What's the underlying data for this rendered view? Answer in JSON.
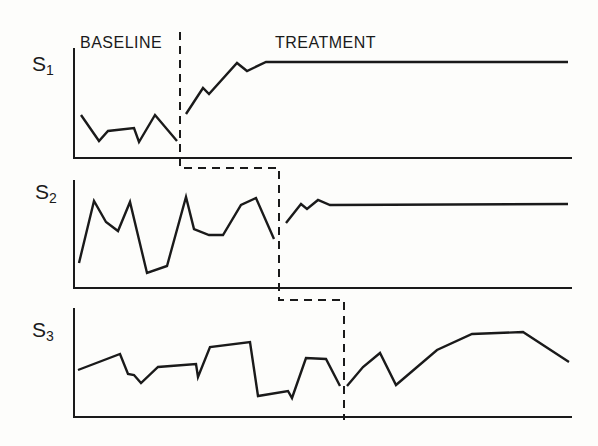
{
  "chart_data": {
    "type": "line",
    "title": "",
    "phase_labels": [
      "BASELINE",
      "TREATMENT"
    ],
    "xlabel": "",
    "ylabel": "",
    "grid": false,
    "legend": "none",
    "design": "multiple-baseline across subjects",
    "series": [
      {
        "name": "S1",
        "label_main": "S",
        "label_sub": "1",
        "axis": {
          "x0": 74,
          "x1": 572,
          "y_top": 48,
          "y_base": 158
        },
        "phase_change_x": 180,
        "baseline": [
          [
            81,
            115
          ],
          [
            99,
            141
          ],
          [
            108,
            131
          ],
          [
            134,
            128
          ],
          [
            139,
            142
          ],
          [
            155,
            115
          ],
          [
            177,
            141
          ]
        ],
        "treatment": [
          [
            186,
            114
          ],
          [
            203,
            88
          ],
          [
            209,
            94
          ],
          [
            237,
            63
          ],
          [
            247,
            71
          ],
          [
            266,
            62
          ],
          [
            568,
            62
          ]
        ]
      },
      {
        "name": "S2",
        "label_main": "S",
        "label_sub": "2",
        "axis": {
          "x0": 74,
          "x1": 572,
          "y_top": 180,
          "y_base": 288
        },
        "phase_change_x": 279,
        "baseline": [
          [
            79,
            263
          ],
          [
            94,
            201
          ],
          [
            106,
            222
          ],
          [
            118,
            231
          ],
          [
            130,
            202
          ],
          [
            147,
            273
          ],
          [
            167,
            266
          ],
          [
            186,
            197
          ],
          [
            194,
            229
          ],
          [
            209,
            235
          ],
          [
            223,
            235
          ],
          [
            241,
            205
          ],
          [
            256,
            198
          ],
          [
            274,
            239
          ]
        ],
        "treatment": [
          [
            286,
            223
          ],
          [
            301,
            204
          ],
          [
            307,
            209
          ],
          [
            318,
            200
          ],
          [
            330,
            205
          ],
          [
            568,
            204
          ]
        ]
      },
      {
        "name": "S3",
        "label_main": "S",
        "label_sub": "3",
        "axis": {
          "x0": 74,
          "x1": 572,
          "y_top": 308,
          "y_base": 417
        },
        "phase_change_x": 344,
        "baseline": [
          [
            78,
            370
          ],
          [
            120,
            354
          ],
          [
            128,
            374
          ],
          [
            134,
            375
          ],
          [
            141,
            383
          ],
          [
            158,
            367
          ],
          [
            196,
            364
          ],
          [
            198,
            377
          ],
          [
            210,
            347
          ],
          [
            250,
            342
          ],
          [
            258,
            396
          ],
          [
            288,
            391
          ],
          [
            292,
            398
          ],
          [
            306,
            358
          ],
          [
            326,
            359
          ],
          [
            340,
            386
          ]
        ],
        "treatment": [
          [
            347,
            386
          ],
          [
            363,
            367
          ],
          [
            380,
            353
          ],
          [
            396,
            385
          ],
          [
            437,
            350
          ],
          [
            472,
            334
          ],
          [
            523,
            332
          ],
          [
            569,
            362
          ]
        ]
      }
    ],
    "phase_divider_path": [
      [
        180,
        32
      ],
      [
        180,
        168
      ],
      [
        279,
        168
      ],
      [
        279,
        300
      ],
      [
        344,
        300
      ],
      [
        344,
        420
      ]
    ]
  },
  "labels": {
    "baseline": "BASELINE",
    "treatment": "TREATMENT",
    "s1_main": "S",
    "s1_sub": "1",
    "s2_main": "S",
    "s2_sub": "2",
    "s3_main": "S",
    "s3_sub": "3"
  },
  "colors": {
    "ink": "#1a1a1a",
    "background": "#fdfdfb"
  }
}
